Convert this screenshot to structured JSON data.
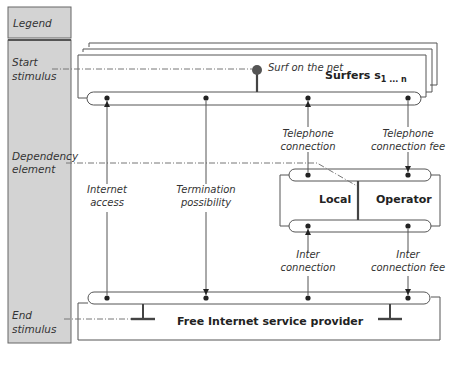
{
  "legend": {
    "header": "Legend",
    "items": [
      {
        "id": "start",
        "lines": [
          "Start",
          "stimulus"
        ]
      },
      {
        "id": "dependency",
        "lines": [
          "Dependency",
          "element"
        ]
      },
      {
        "id": "end",
        "lines": [
          "End",
          "stimulus"
        ]
      }
    ]
  },
  "actors": {
    "surfers": {
      "name": "Surfers s",
      "subscript": "1 ... n"
    },
    "local": {
      "name": "Local"
    },
    "operator": {
      "name": "Operator"
    },
    "isp": {
      "name": "Free Internet service provider"
    }
  },
  "stimulus": {
    "start_label": "Surf on the net"
  },
  "dependencies": [
    {
      "id": "internet-access",
      "lines": [
        "Internet",
        "access"
      ]
    },
    {
      "id": "termination-possibility",
      "lines": [
        "Termination",
        "possibility"
      ]
    },
    {
      "id": "telephone-connection",
      "lines": [
        "Telephone",
        "connection"
      ]
    },
    {
      "id": "telephone-connection-fee",
      "lines": [
        "Telephone",
        "connection fee"
      ]
    },
    {
      "id": "inter-connection",
      "lines": [
        "Inter",
        "connection"
      ]
    },
    {
      "id": "inter-connection-fee",
      "lines": [
        "Inter",
        "connection fee"
      ]
    }
  ],
  "colors": {
    "legend_fill": "#d3d3d3",
    "legend_border": "#666666",
    "line": "#555555",
    "port": "#222222",
    "background": "#ffffff"
  }
}
